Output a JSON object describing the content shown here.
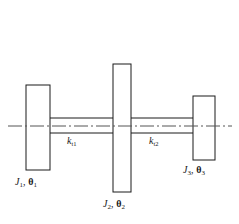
{
  "figure": {
    "type": "engineering-diagram",
    "background_color": "#ffffff",
    "line_color": "#1a1a1a",
    "centerline_color": "#4d4d4d"
  },
  "labels": {
    "disk1": {
      "inertia": "J",
      "inertia_sub": "1",
      "theta": "θ",
      "theta_sub": "1",
      "separator": ", "
    },
    "disk2": {
      "inertia": "J",
      "inertia_sub": "2",
      "theta": "θ",
      "theta_sub": "2",
      "separator": ", "
    },
    "disk3": {
      "inertia": "J",
      "inertia_sub": "3",
      "theta": "θ",
      "theta_sub": "3",
      "separator": ", "
    },
    "stiffness1": {
      "symbol": "k",
      "sub": "t1"
    },
    "stiffness2": {
      "symbol": "k",
      "sub": "t2"
    }
  },
  "geometry": {
    "disk1": {
      "x": 26,
      "y": 85,
      "width": 24,
      "height": 85
    },
    "disk2": {
      "x": 113,
      "y": 64,
      "width": 18,
      "height": 128
    },
    "disk3": {
      "x": 193,
      "y": 96,
      "width": 22,
      "height": 64
    },
    "shaft": {
      "top_y": 118,
      "bottom_y": 133,
      "left_x": 50,
      "right_x": 193
    },
    "centerline": {
      "y": 126,
      "left_x": 8,
      "right_x": 232
    }
  }
}
